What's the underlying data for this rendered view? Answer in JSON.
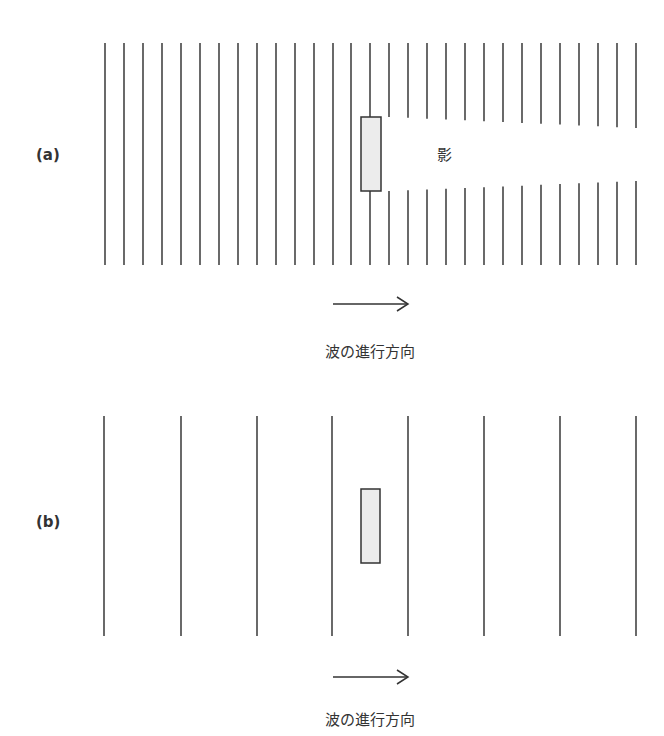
{
  "figures": [
    {
      "label": "(a)",
      "description": "short wavelength waves blocked by obstacle, creating a shadow",
      "shadow_label": "影",
      "direction_caption": "波の進行方向",
      "wavefronts": {
        "count": 29,
        "x_start": 105,
        "spacing": 18.96,
        "y_top": 43,
        "y_bottom": 265
      },
      "obstacle": {
        "x": 361,
        "y": 117,
        "width": 20,
        "height": 74
      },
      "gap": {
        "start_x": 390,
        "top_y_near": 117,
        "top_y_far": 128,
        "bottom_y_near": 191,
        "bottom_y_far": 181
      }
    },
    {
      "label": "(b)",
      "description": "long wavelength waves diffract around obstacle, no shadow",
      "direction_caption": "波の進行方向",
      "wavefronts": {
        "x": [
          104,
          181,
          257,
          332,
          408,
          484,
          560,
          636
        ],
        "y_top": 416,
        "y_bottom": 636
      },
      "obstacle": {
        "x": 361,
        "y": 489,
        "width": 19,
        "height": 74
      }
    }
  ],
  "colors": {
    "line": "#444444",
    "obstacle_fill": "#ececec",
    "text": "#333333"
  }
}
